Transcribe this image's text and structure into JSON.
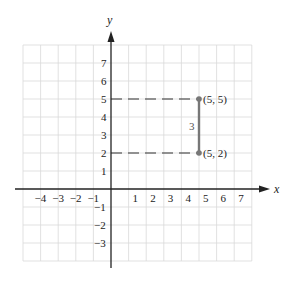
{
  "diagram": {
    "type": "coordinate-plane",
    "axes": {
      "x_label": "x",
      "y_label": "y",
      "x_ticks": [
        "−4",
        "−3",
        "−2",
        "−1",
        "1",
        "2",
        "3",
        "4",
        "5",
        "6",
        "7"
      ],
      "y_ticks_positive": [
        "1",
        "2",
        "3",
        "4",
        "5",
        "6",
        "7"
      ],
      "y_ticks_negative": [
        "−1",
        "−2",
        "−3"
      ]
    },
    "grid": {
      "x_min": -5,
      "x_max": 8,
      "y_min": -4,
      "y_max": 8
    },
    "points": [
      {
        "label": "(5, 5)",
        "x": 5,
        "y": 5
      },
      {
        "label": "(5, 2)",
        "x": 5,
        "y": 2
      }
    ],
    "segment": {
      "from": [
        5,
        2
      ],
      "to": [
        5,
        5
      ],
      "length_label": "3"
    },
    "dashed_guides": [
      {
        "from": [
          0,
          5
        ],
        "to": [
          5,
          5
        ]
      },
      {
        "from": [
          0,
          2
        ],
        "to": [
          5,
          2
        ]
      }
    ],
    "colors": {
      "grid": "#d9d9d9",
      "axis": "#222222",
      "segment": "#777777",
      "point": "#777777"
    }
  }
}
